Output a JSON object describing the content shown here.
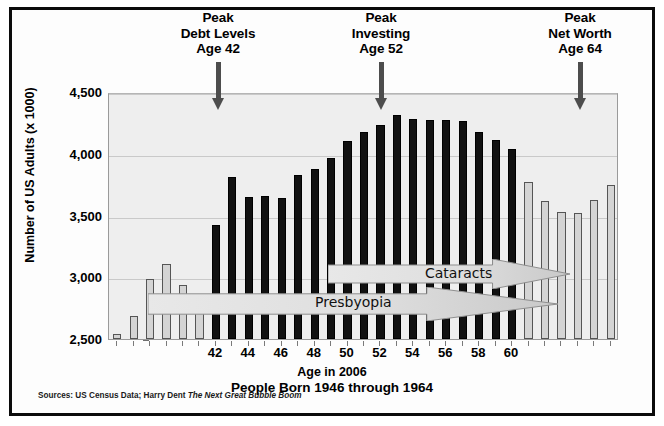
{
  "figure": {
    "source_note_prefix": "Sources:",
    "source_note": "US Census Data; Harry Dent",
    "source_note_italic": "The Next Great Bubble Boom"
  },
  "callouts": [
    {
      "name": "peak-debt",
      "lines": [
        "Peak",
        "Debt Levels",
        "Age 42"
      ],
      "age": 42,
      "x": 218
    },
    {
      "name": "peak-investing",
      "lines": [
        "Peak",
        "Investing",
        "Age 52"
      ],
      "age": 52,
      "x": 381
    },
    {
      "name": "peak-networth",
      "lines": [
        "Peak",
        "Net Worth",
        "Age 64"
      ],
      "age": 64,
      "x": 580
    }
  ],
  "conditions": [
    {
      "name": "presbyopia",
      "label": "Presbyopia"
    },
    {
      "name": "cataracts",
      "label": "Cataracts"
    }
  ],
  "chart_data": {
    "type": "bar",
    "title": "",
    "xlabel": "Age in 2006",
    "xsublabel": "People Born 1946 through 1964",
    "ylabel": "Number of US Adults (x 1000)",
    "ylim": [
      2500,
      4500
    ],
    "yticks": [
      2500,
      3000,
      3500,
      4000,
      4500
    ],
    "ytick_labels": [
      "2,500",
      "3,000",
      "3,500",
      "4,000",
      "4,500"
    ],
    "xticks": [
      42,
      44,
      46,
      48,
      50,
      52,
      54,
      56,
      58,
      60
    ],
    "xtick_labels": [
      "42",
      "44",
      "46",
      "48",
      "50",
      "52",
      "54",
      "56",
      "58",
      "60"
    ],
    "grid": true,
    "legend": "none",
    "categories": [
      36,
      37,
      38,
      39,
      40,
      41,
      42,
      43,
      44,
      45,
      46,
      47,
      48,
      49,
      50,
      51,
      52,
      53,
      54,
      55,
      56,
      57,
      58,
      59,
      60,
      61,
      62,
      63,
      64,
      65,
      66
    ],
    "values": [
      2540,
      2690,
      2990,
      3105,
      2940,
      2820,
      3420,
      3810,
      3650,
      3660,
      3645,
      3830,
      3880,
      3965,
      4105,
      4180,
      4230,
      4310,
      4280,
      4270,
      4275,
      4265,
      4175,
      4115,
      4035,
      3770,
      3620,
      3530,
      3520,
      3625,
      3750
    ],
    "highlight_categories": [
      42,
      43,
      44,
      45,
      46,
      47,
      48,
      49,
      50,
      51,
      52,
      53,
      54,
      55,
      56,
      57,
      58,
      59,
      60
    ],
    "colors": {
      "highlight": "#111111",
      "other": "#d4d4d4",
      "plot_bg": "#eeeeee",
      "arrow": "#4d4d4d"
    }
  }
}
